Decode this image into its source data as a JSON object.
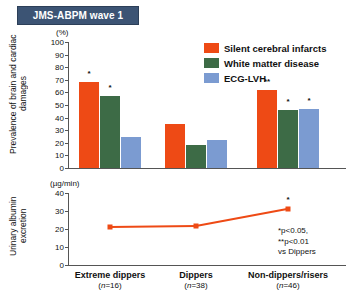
{
  "title": "JMS-ABPM wave 1",
  "colors": {
    "orange": "#ee4a15",
    "green": "#3d6b46",
    "blue": "#7b9bd1",
    "title_bar": "#3c5474",
    "axis": "#555555"
  },
  "legend": {
    "items": [
      {
        "label": "Silent cerebral infarcts",
        "color": "#ee4a15"
      },
      {
        "label": "White matter disease",
        "color": "#3d6b46"
      },
      {
        "label": "ECG-LVH",
        "color": "#7b9bd1"
      }
    ]
  },
  "footnote": "*p<0.05,\n**p<0.01\nvs Dippers",
  "categories": [
    {
      "name": "Extreme dippers",
      "n": "(n=16)"
    },
    {
      "name": "Dippers",
      "n": "(n=38)"
    },
    {
      "name": "Non-dippers/risers",
      "n": "(n=46)"
    }
  ],
  "chart_data": [
    {
      "type": "bar",
      "title": "JMS-ABPM wave 1",
      "ylabel": "Prevalence of brain and cardiac damages",
      "yunit": "(%)",
      "xlabel": "",
      "ylim": [
        0,
        100
      ],
      "yticks": [
        0,
        10,
        20,
        30,
        40,
        50,
        60,
        70,
        80,
        90,
        100
      ],
      "grid": false,
      "legend_position": "top-right",
      "categories": [
        "Extreme dippers",
        "Dippers",
        "Non-dippers/risers"
      ],
      "series": [
        {
          "name": "Silent cerebral infarcts",
          "color": "#ee4a15",
          "values": [
            68,
            35,
            62
          ],
          "annotations": [
            "*",
            "",
            "**"
          ]
        },
        {
          "name": "White matter disease",
          "color": "#3d6b46",
          "values": [
            57,
            18,
            46
          ],
          "annotations": [
            "*",
            "",
            "*"
          ]
        },
        {
          "name": "ECG-LVH",
          "color": "#7b9bd1",
          "values": [
            25,
            22,
            47
          ],
          "annotations": [
            "",
            "",
            "*"
          ]
        }
      ]
    },
    {
      "type": "line",
      "ylabel": "Urinary albumin excretion",
      "yunit": "(µg/min)",
      "xlabel": "",
      "ylim": [
        0,
        40
      ],
      "yticks": [
        0,
        10,
        20,
        30,
        40
      ],
      "grid": false,
      "categories": [
        "Extreme dippers",
        "Dippers",
        "Non-dippers/risers"
      ],
      "series": [
        {
          "name": "Urinary albumin excretion",
          "color": "#ee4a15",
          "values": [
            21,
            21.5,
            31
          ],
          "annotations": [
            "",
            "",
            "*"
          ]
        }
      ]
    }
  ]
}
